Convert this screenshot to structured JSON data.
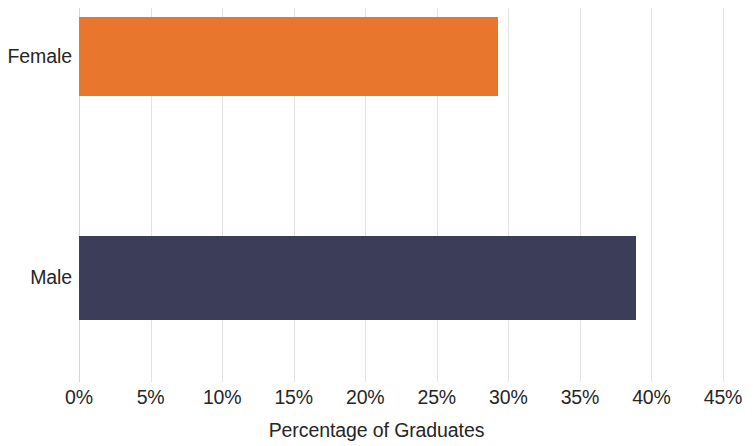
{
  "chart_data": {
    "type": "bar",
    "orientation": "horizontal",
    "title": "",
    "subtitle": "",
    "xlabel": "Percentage of Graduates",
    "ylabel": "",
    "categories": [
      "Female",
      "Male"
    ],
    "values": [
      29.3,
      38.9
    ],
    "series": [
      {
        "name": "Percentage of Graduates",
        "values": [
          29.3,
          38.9
        ]
      }
    ],
    "bar_colors": [
      "#e8762c",
      "#3c3d58"
    ],
    "xlim": [
      0,
      45
    ],
    "xtick_values": [
      0,
      5,
      10,
      15,
      20,
      25,
      30,
      35,
      40,
      45
    ],
    "xtick_labels": [
      "0%",
      "5%",
      "10%",
      "15%",
      "20%",
      "25%",
      "30%",
      "35%",
      "40%",
      "45%"
    ],
    "grid": "vertical",
    "grid_color": "#e3e3e3",
    "legend": "none",
    "data_labels": "none",
    "background": "#ffffff",
    "text_color": "#262626"
  },
  "axis": {
    "x_title": "Percentage of Graduates",
    "ticks": [
      {
        "label": "0%",
        "value": 0
      },
      {
        "label": "5%",
        "value": 5
      },
      {
        "label": "10%",
        "value": 10
      },
      {
        "label": "15%",
        "value": 15
      },
      {
        "label": "20%",
        "value": 20
      },
      {
        "label": "25%",
        "value": 25
      },
      {
        "label": "30%",
        "value": 30
      },
      {
        "label": "35%",
        "value": 35
      },
      {
        "label": "40%",
        "value": 40
      },
      {
        "label": "45%",
        "value": 45
      }
    ]
  },
  "categories": [
    {
      "label": "Female",
      "value": 29.3,
      "color": "#e8762c"
    },
    {
      "label": "Male",
      "value": 38.9,
      "color": "#3c3d58"
    }
  ]
}
